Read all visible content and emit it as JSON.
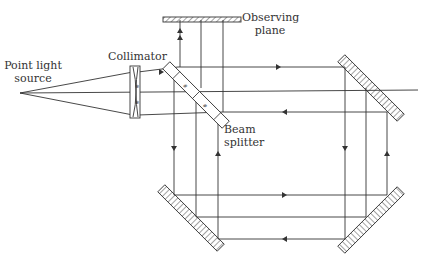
{
  "diagram": {
    "type": "Sagnac-type interferometer optical layout",
    "labels": {
      "source_line1": "Point light",
      "source_line2": "source",
      "collimator": "Collimator",
      "observing_line1": "Observing",
      "observing_line2": "plane",
      "beam_line1": "Beam",
      "beam_line2": "splitter"
    },
    "components": [
      "point-light-source",
      "collimator",
      "beam-splitter",
      "observing-plane",
      "mirror-top-right",
      "mirror-bottom-left",
      "mirror-bottom-right"
    ],
    "colors": {
      "line": "#333333",
      "background": "#ffffff"
    }
  }
}
